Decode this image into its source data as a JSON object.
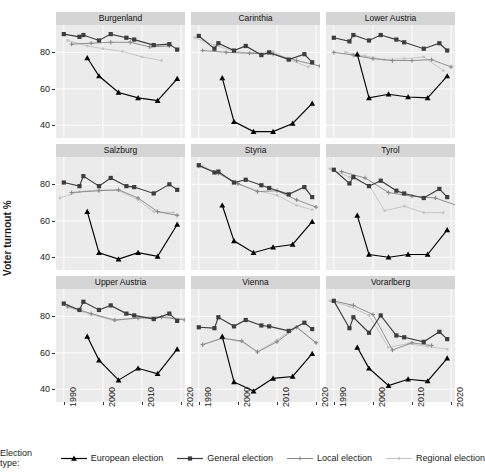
{
  "chart_data": {
    "type": "line",
    "title": "",
    "xlabel": "",
    "ylabel": "Voter turnout %",
    "xlim": [
      1988,
      2021
    ],
    "ylim": [
      33,
      95
    ],
    "xticks": [
      1990,
      2000,
      2010,
      2020
    ],
    "xticklabels": [
      "1990",
      "2000",
      "2010",
      "2020"
    ],
    "yticks": [
      40,
      60,
      80
    ],
    "yticklabels": [
      "40",
      "60",
      "80"
    ],
    "grid": true,
    "legend_position": "bottom",
    "legend_title": "Election type:",
    "facet_layout": [
      3,
      3
    ],
    "series_names": [
      "European election",
      "General election",
      "Local election",
      "Regional election"
    ],
    "series_colors": [
      "#000000",
      "#3d3d3d",
      "#8a8a8a",
      "#c4c4c4"
    ],
    "series_markers": [
      "triangle",
      "square",
      "cross",
      "dot"
    ],
    "panels": [
      {
        "name": "Burgenland",
        "series": [
          {
            "name": "European election",
            "x": [
              1996,
              1999,
              2004,
              2009,
              2014,
              2019
            ],
            "y": [
              77.0,
              67.0,
              58.0,
              55.0,
              53.5,
              65.5
            ]
          },
          {
            "name": "General election",
            "x": [
              1990,
              1994,
              1995,
              1999,
              2002,
              2006,
              2008,
              2013,
              2017,
              2019
            ],
            "y": [
              90.0,
              88.5,
              89.5,
              86.5,
              90.0,
              88.0,
              87.0,
              84.0,
              84.5,
              81.5
            ]
          },
          {
            "name": "Local election",
            "x": [
              1992,
              1997,
              2002,
              2007,
              2012,
              2017
            ],
            "y": [
              84.5,
              85.0,
              85.5,
              85.5,
              83.0,
              83.5
            ]
          },
          {
            "name": "Regional election",
            "x": [
              1991,
              1996,
              2000,
              2005,
              2010,
              2015
            ],
            "y": [
              86.5,
              83.5,
              82.0,
              80.5,
              77.5,
              75.5
            ]
          }
        ]
      },
      {
        "name": "Carinthia",
        "series": [
          {
            "name": "European election",
            "x": [
              1996,
              1999,
              2004,
              2009,
              2014,
              2019
            ],
            "y": [
              66.0,
              42.0,
              36.5,
              36.5,
              41.0,
              52.0
            ]
          },
          {
            "name": "General election",
            "x": [
              1990,
              1994,
              1995,
              1999,
              2002,
              2006,
              2008,
              2013,
              2017,
              2019
            ],
            "y": [
              89.0,
              82.0,
              85.0,
              81.0,
              83.5,
              78.5,
              80.0,
              76.0,
              79.0,
              74.5
            ]
          },
          {
            "name": "Local election",
            "x": [
              1991,
              1997,
              2003,
              2009,
              2015,
              2021
            ],
            "y": [
              81.0,
              80.0,
              79.5,
              79.0,
              75.5,
              72.5
            ]
          },
          {
            "name": "Regional election",
            "x": [
              1989,
              1994,
              1999,
              2004,
              2009,
              2013,
              2018
            ],
            "y": [
              88.0,
              84.0,
              80.5,
              79.5,
              80.5,
              76.0,
              72.0
            ]
          }
        ]
      },
      {
        "name": "Lower Austria",
        "series": [
          {
            "name": "European election",
            "x": [
              1996,
              1999,
              2004,
              2009,
              2014,
              2019
            ],
            "y": [
              79.0,
              55.0,
              57.0,
              55.5,
              55.0,
              67.0
            ]
          },
          {
            "name": "General election",
            "x": [
              1990,
              1994,
              1995,
              1999,
              2002,
              2006,
              2008,
              2013,
              2017,
              2019
            ],
            "y": [
              88.0,
              86.0,
              89.5,
              86.5,
              89.5,
              87.0,
              85.5,
              82.0,
              85.0,
              81.0
            ]
          },
          {
            "name": "Local election",
            "x": [
              1990,
              1995,
              2000,
              2005,
              2010,
              2015,
              2020
            ],
            "y": [
              80.0,
              78.5,
              76.5,
              75.5,
              75.5,
              76.0,
              72.0
            ]
          },
          {
            "name": "Regional election",
            "x": [
              1993,
              1998,
              2003,
              2008,
              2013,
              2018
            ],
            "y": [
              80.0,
              78.0,
              76.0,
              76.5,
              77.5,
              70.0
            ]
          }
        ]
      },
      {
        "name": "Salzburg",
        "series": [
          {
            "name": "European election",
            "x": [
              1996,
              1999,
              2004,
              2009,
              2014,
              2019
            ],
            "y": [
              65.0,
              42.5,
              39.0,
              42.5,
              40.5,
              58.0
            ]
          },
          {
            "name": "General election",
            "x": [
              1990,
              1994,
              1995,
              1999,
              2002,
              2006,
              2008,
              2013,
              2017,
              2019
            ],
            "y": [
              81.0,
              79.0,
              84.5,
              79.0,
              83.5,
              79.0,
              78.5,
              75.0,
              80.0,
              77.0
            ]
          },
          {
            "name": "Local election",
            "x": [
              1992,
              1999,
              2004,
              2009,
              2014,
              2019
            ],
            "y": [
              75.5,
              76.5,
              77.0,
              72.5,
              65.0,
              63.0
            ]
          },
          {
            "name": "Regional election",
            "x": [
              1989,
              1994,
              1999,
              2004,
              2009,
              2013,
              2018
            ],
            "y": [
              72.5,
              76.0,
              77.0,
              76.5,
              71.5,
              65.0,
              64.5
            ]
          }
        ]
      },
      {
        "name": "Styria",
        "series": [
          {
            "name": "European election",
            "x": [
              1996,
              1999,
              2004,
              2009,
              2014,
              2019
            ],
            "y": [
              68.5,
              49.0,
              42.5,
              45.5,
              47.0,
              59.5
            ]
          },
          {
            "name": "General election",
            "x": [
              1990,
              1994,
              1995,
              1999,
              2002,
              2006,
              2008,
              2013,
              2017,
              2019
            ],
            "y": [
              90.5,
              86.5,
              87.0,
              81.0,
              82.5,
              79.5,
              78.0,
              74.5,
              78.5,
              73.0
            ]
          },
          {
            "name": "Local election",
            "x": [
              1990,
              1995,
              2000,
              2005,
              2010,
              2015,
              2020
            ],
            "y": [
              90.0,
              86.0,
              80.5,
              76.0,
              76.5,
              71.5,
              67.5
            ]
          },
          {
            "name": "Regional election",
            "x": [
              1991,
              1995,
              2000,
              2005,
              2010,
              2015,
              2019
            ],
            "y": [
              90.0,
              86.0,
              80.0,
              76.5,
              74.0,
              68.5,
              66.0
            ]
          }
        ]
      },
      {
        "name": "Tyrol",
        "series": [
          {
            "name": "European election",
            "x": [
              1996,
              1999,
              2004,
              2009,
              2014,
              2019
            ],
            "y": [
              63.0,
              41.5,
              40.0,
              41.5,
              41.5,
              55.0
            ]
          },
          {
            "name": "General election",
            "x": [
              1990,
              1994,
              1995,
              1999,
              2002,
              2006,
              2008,
              2013,
              2017,
              2019
            ],
            "y": [
              88.0,
              80.5,
              84.0,
              79.0,
              82.0,
              76.5,
              75.0,
              72.5,
              77.5,
              73.0
            ]
          },
          {
            "name": "Local election",
            "x": [
              1992,
              1998,
              2004,
              2010,
              2016,
              2022
            ],
            "y": [
              87.0,
              83.5,
              75.5,
              73.5,
              72.5,
              68.0
            ]
          },
          {
            "name": "Regional election",
            "x": [
              1989,
              1994,
              1999,
              2003,
              2008,
              2013,
              2018
            ],
            "y": [
              88.5,
              84.0,
              79.5,
              65.5,
              68.0,
              64.5,
              64.5
            ]
          }
        ]
      },
      {
        "name": "Upper Austria",
        "series": [
          {
            "name": "European election",
            "x": [
              1996,
              1999,
              2004,
              2009,
              2014,
              2019
            ],
            "y": [
              69.0,
              56.0,
              45.0,
              51.5,
              48.5,
              62.0
            ]
          },
          {
            "name": "General election",
            "x": [
              1990,
              1994,
              1995,
              1999,
              2002,
              2006,
              2008,
              2013,
              2017,
              2019
            ],
            "y": [
              87.0,
              83.5,
              88.0,
              83.5,
              86.0,
              81.5,
              80.5,
              78.5,
              81.5,
              77.5
            ]
          },
          {
            "name": "Local election",
            "x": [
              1991,
              1997,
              2003,
              2009,
              2015,
              2021
            ],
            "y": [
              85.5,
              81.5,
              78.0,
              79.0,
              79.5,
              78.0
            ]
          },
          {
            "name": "Regional election",
            "x": [
              1991,
              1997,
              2003,
              2009,
              2015,
              2021
            ],
            "y": [
              85.0,
              81.0,
              77.5,
              79.5,
              80.0,
              78.5
            ]
          }
        ]
      },
      {
        "name": "Vienna",
        "series": [
          {
            "name": "European election",
            "x": [
              1996,
              1999,
              2004,
              2009,
              2014,
              2019
            ],
            "y": [
              69.0,
              44.0,
              39.0,
              46.0,
              47.0,
              59.5
            ]
          },
          {
            "name": "General election",
            "x": [
              1990,
              1994,
              1995,
              1999,
              2002,
              2006,
              2008,
              2013,
              2017,
              2019
            ],
            "y": [
              74.0,
              73.5,
              79.5,
              74.5,
              78.0,
              75.0,
              74.5,
              72.0,
              76.5,
              73.0
            ]
          },
          {
            "name": "Local election",
            "x": [
              1991,
              1996,
              2001,
              2005,
              2010,
              2015,
              2020
            ],
            "y": [
              64.5,
              68.0,
              66.5,
              60.5,
              66.0,
              74.0,
              65.5
            ]
          },
          {
            "name": "Regional election",
            "x": [
              1991,
              1996,
              2001,
              2005,
              2010,
              2015,
              2020
            ],
            "y": [
              64.5,
              68.0,
              66.0,
              60.5,
              67.0,
              74.5,
              65.5
            ]
          }
        ]
      },
      {
        "name": "Vorarlberg",
        "series": [
          {
            "name": "European election",
            "x": [
              1996,
              1999,
              2004,
              2009,
              2014,
              2019
            ],
            "y": [
              63.0,
              51.5,
              42.0,
              45.5,
              44.5,
              57.0
            ]
          },
          {
            "name": "General election",
            "x": [
              1990,
              1994,
              1995,
              1999,
              2002,
              2006,
              2008,
              2013,
              2017,
              2019
            ],
            "y": [
              88.5,
              73.5,
              79.5,
              71.0,
              80.5,
              69.5,
              68.5,
              66.0,
              71.5,
              67.5
            ]
          },
          {
            "name": "Local election",
            "x": [
              1990,
              1995,
              2000,
              2005,
              2010,
              2015
            ],
            "y": [
              88.5,
              86.0,
              81.0,
              61.5,
              65.5,
              64.0
            ]
          },
          {
            "name": "Regional election",
            "x": [
              1989,
              1994,
              1999,
              2004,
              2009,
              2014,
              2019
            ],
            "y": [
              88.5,
              85.5,
              80.5,
              63.0,
              65.0,
              63.5,
              62.0
            ]
          }
        ]
      }
    ]
  },
  "legend": {
    "title": "Election type:",
    "items": [
      {
        "label": "European election"
      },
      {
        "label": "General election"
      },
      {
        "label": "Local election"
      },
      {
        "label": "Regional election"
      }
    ]
  },
  "axes": {
    "y_title": "Voter turnout %"
  }
}
